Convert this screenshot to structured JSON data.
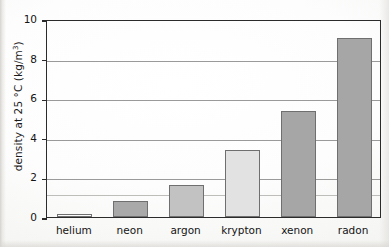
{
  "chart_data": {
    "type": "bar",
    "title": "",
    "xlabel": "",
    "ylabel": "density at 25 °C (kg/m3)",
    "ylabel_prefix": "density at 25 °C (kg/m",
    "ylabel_exponent": "3",
    "ylabel_suffix": ")",
    "categories": [
      "helium",
      "neon",
      "argon",
      "krypton",
      "xenon",
      "radon"
    ],
    "values": [
      0.16,
      0.8,
      1.6,
      3.4,
      5.35,
      9.05
    ],
    "ylim": [
      0,
      10
    ],
    "ytick_labels": [
      "0",
      "2",
      "4",
      "6",
      "8",
      "10"
    ],
    "ytick_values": [
      0,
      2,
      4,
      6,
      8,
      10
    ],
    "grid": true,
    "legend": "none",
    "bar_colors": [
      "#fbfbfb",
      "#a9a9a9",
      "#c2c2c2",
      "#e2e2e2",
      "#a6a6a6",
      "#a6a6a6"
    ],
    "bar_border_color": "#6f6f6f",
    "axis_color": "#2b2b2b",
    "gridline_color": "#9a9a9a"
  }
}
